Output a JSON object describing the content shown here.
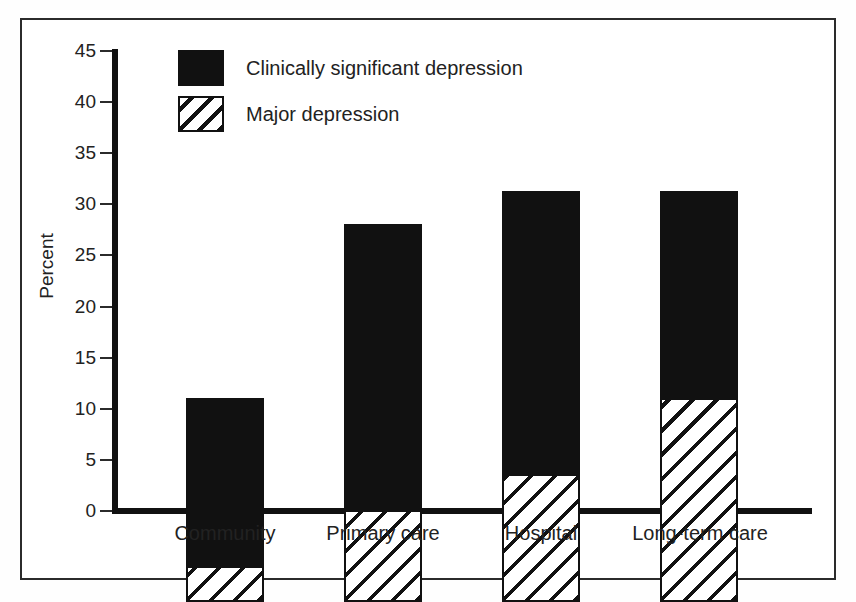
{
  "chart_data": {
    "type": "bar",
    "subtype": "stacked-bar",
    "title": "",
    "xlabel": "",
    "ylabel": "Percent",
    "ylim": [
      0,
      45
    ],
    "ytick_step": 5,
    "yticks": [
      45,
      40,
      35,
      30,
      25,
      20,
      15,
      10,
      5,
      0
    ],
    "grid": false,
    "legend_position": "inside top-left",
    "categories": [
      "Community",
      "Primary care",
      "Hospital",
      "Long-term care"
    ],
    "series": [
      {
        "name": "Major depression",
        "pattern": "diagonal-hatch",
        "color": "#ffffff",
        "values": [
          3.5,
          9.0,
          12.5,
          20.0
        ]
      },
      {
        "name": "Clinically significant depression",
        "pattern": "solid",
        "color": "#111111",
        "values": [
          16.5,
          28.0,
          27.7,
          20.2
        ]
      }
    ],
    "totals": [
      20.0,
      37.0,
      40.2,
      40.2
    ]
  },
  "legend": {
    "items": [
      {
        "label": "Clinically significant depression",
        "swatch": "solid-black-swatch"
      },
      {
        "label": "Major depression",
        "swatch": "hatched-swatch"
      }
    ]
  },
  "axis": {
    "y_title": "Percent",
    "y_tick_labels": [
      "45",
      "40",
      "35",
      "30",
      "25",
      "20",
      "15",
      "10",
      "5",
      "0"
    ],
    "x_tick_labels": [
      "Community",
      "Primary care",
      "Hospital",
      "Long-term care"
    ]
  }
}
